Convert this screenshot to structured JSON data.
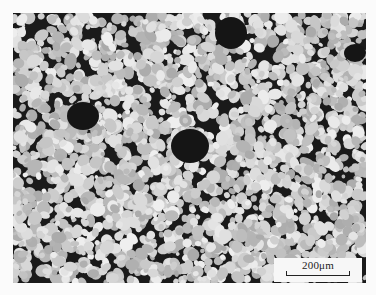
{
  "image": {
    "description": "Grayscale optical micrograph of a dense field of bright rounded grains on a dark matrix, with several larger dark particles",
    "colors": {
      "background": "#fbfbfb",
      "matrix": "#1a1a1a",
      "grain": "#d8d8d8",
      "dark_particle": "#151515"
    }
  },
  "scale_bar": {
    "label": "200μm"
  }
}
